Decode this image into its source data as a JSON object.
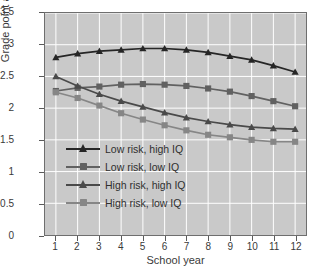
{
  "chart_data": {
    "type": "line",
    "title": "",
    "xlabel": "School year",
    "ylabel": "Grade point average",
    "x": [
      1,
      2,
      3,
      4,
      5,
      6,
      7,
      8,
      9,
      10,
      11,
      12
    ],
    "xtick_labels": [
      "1",
      "2",
      "3",
      "4",
      "5",
      "6",
      "7",
      "8",
      "9",
      "10",
      "11",
      "12"
    ],
    "ytick_labels": [
      "0",
      "0.5",
      "1",
      "1.5",
      "2",
      "2.5",
      "3",
      "3.5"
    ],
    "ytick_values": [
      0,
      0.5,
      1,
      1.5,
      2,
      2.5,
      3,
      3.5
    ],
    "xlim": [
      0.5,
      12.5
    ],
    "ylim": [
      0,
      3.5
    ],
    "grid": true,
    "legend_position": "center-left",
    "plot_background": "#c9c9c9",
    "grid_color": "#ffffff",
    "series": [
      {
        "name": "Low risk, high IQ",
        "marker": "triangle",
        "color": "#262626",
        "values": [
          2.8,
          2.86,
          2.9,
          2.92,
          2.94,
          2.94,
          2.92,
          2.88,
          2.82,
          2.76,
          2.67,
          2.57
        ]
      },
      {
        "name": "Low risk, low IQ",
        "marker": "square",
        "color": "#616161",
        "values": [
          2.27,
          2.32,
          2.34,
          2.37,
          2.38,
          2.37,
          2.35,
          2.31,
          2.26,
          2.19,
          2.11,
          2.03
        ]
      },
      {
        "name": "High risk, high IQ",
        "marker": "triangle",
        "color": "#4a4a4a",
        "values": [
          2.5,
          2.35,
          2.22,
          2.11,
          2.02,
          1.93,
          1.85,
          1.79,
          1.74,
          1.7,
          1.68,
          1.67
        ]
      },
      {
        "name": "High risk, low IQ",
        "marker": "square",
        "color": "#868686",
        "values": [
          2.25,
          2.16,
          2.04,
          1.92,
          1.82,
          1.73,
          1.65,
          1.58,
          1.54,
          1.5,
          1.47,
          1.47
        ]
      }
    ]
  }
}
